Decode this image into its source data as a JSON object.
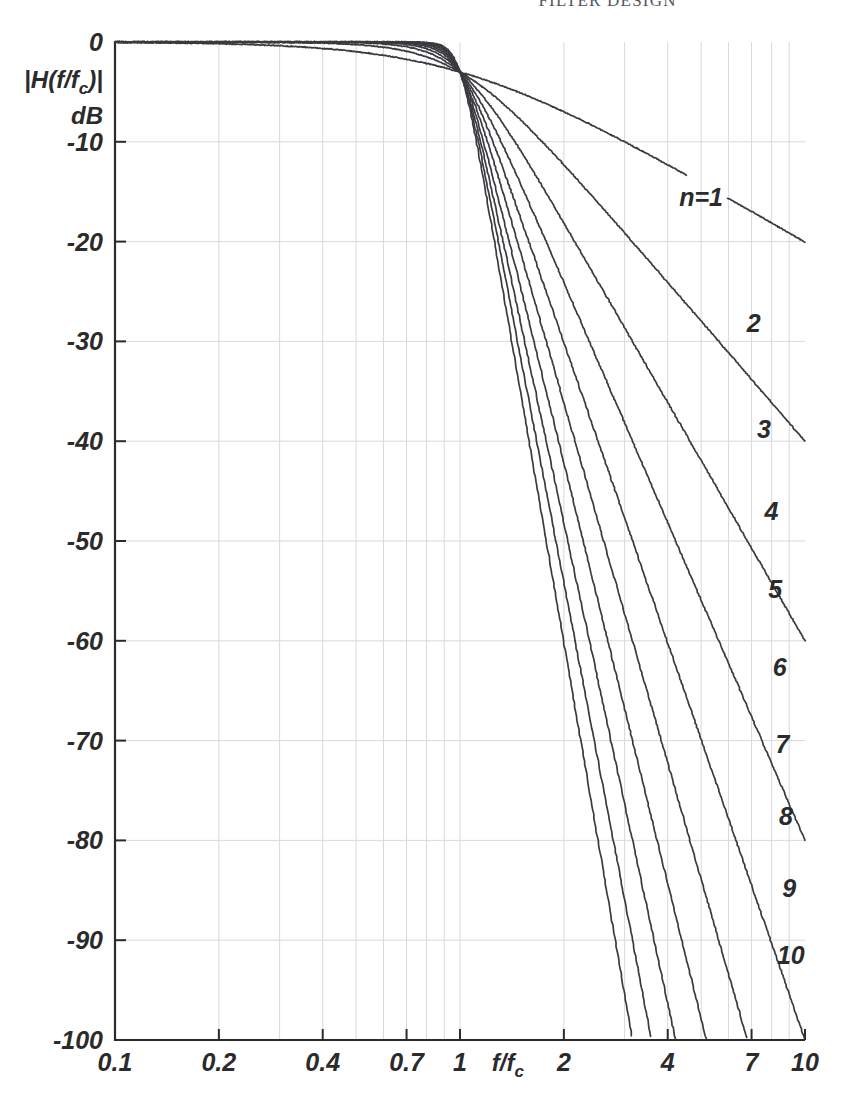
{
  "running_head": "FILTER DESIGN",
  "chart_data": {
    "type": "line",
    "title": "",
    "xlabel": "f/f",
    "xlabel_sub": "c",
    "ylabel_line1": "|H(f/f",
    "ylabel_line1_sub": "c",
    "ylabel_line1_end": ")|",
    "ylabel_line2": "dB",
    "xscale": "log",
    "yscale": "linear",
    "xlim": [
      0.1,
      10
    ],
    "ylim": [
      -100,
      0
    ],
    "grid": true,
    "legend_position": "inline-right",
    "xticks": [
      0.1,
      0.2,
      0.4,
      0.7,
      1,
      2,
      4,
      7,
      10
    ],
    "xtick_labels": [
      "0.1",
      "0.2",
      "0.4",
      "0.7",
      "1",
      "2",
      "4",
      "7",
      "10"
    ],
    "yticks": [
      0,
      -10,
      -20,
      -30,
      -40,
      -50,
      -60,
      -70,
      -80,
      -90,
      -100
    ],
    "ytick_labels": [
      "0",
      "-10",
      "-20",
      "-30",
      "-40",
      "-50",
      "-60",
      "-70",
      "-80",
      "-90",
      "-100"
    ],
    "minor_x_gridlines": [
      0.1,
      0.2,
      0.3,
      0.4,
      0.5,
      0.6,
      0.7,
      0.8,
      0.9,
      1,
      2,
      3,
      4,
      5,
      6,
      7,
      8,
      9,
      10
    ],
    "formula": "20*log10(1/sqrt(1+(f/fc)^(2n)))",
    "series": [
      {
        "name": "n=1",
        "order": 1,
        "label": "n=1",
        "label_x": 5.0,
        "label_y": -15.5,
        "value_at_10": -20.04
      },
      {
        "name": "n=2",
        "order": 2,
        "label": "2",
        "label_x": 7.1,
        "label_y": -28.2,
        "value_at_10": -40.0
      },
      {
        "name": "n=3",
        "order": 3,
        "label": "3",
        "label_x": 7.6,
        "label_y": -38.8,
        "value_at_10": -60.0
      },
      {
        "name": "n=4",
        "order": 4,
        "label": "4",
        "label_x": 8.0,
        "label_y": -47.0,
        "value_at_10": -80.0
      },
      {
        "name": "n=5",
        "order": 5,
        "label": "5",
        "label_x": 8.2,
        "label_y": -54.8,
        "value_at_10": -100.0
      },
      {
        "name": "n=6",
        "order": 6,
        "label": "6",
        "label_x": 8.45,
        "label_y": -62.6,
        "value_at_10": -120.0
      },
      {
        "name": "n=7",
        "order": 7,
        "label": "7",
        "label_x": 8.6,
        "label_y": -70.3,
        "value_at_10": -140.0
      },
      {
        "name": "n=8",
        "order": 8,
        "label": "8",
        "label_x": 8.8,
        "label_y": -77.6,
        "value_at_10": -160.0
      },
      {
        "name": "n=9",
        "order": 9,
        "label": "9",
        "label_x": 9.0,
        "label_y": -84.8,
        "value_at_10": -180.0
      },
      {
        "name": "n=10",
        "order": 10,
        "label": "10",
        "label_x": 9.1,
        "label_y": -91.5,
        "value_at_10": -200.0
      }
    ],
    "reference_points": [
      {
        "x": 1,
        "y": -3.01,
        "note": "all curves pass through -3 dB at f/fc = 1"
      }
    ],
    "colors": {
      "curve": "#3a3a3f",
      "axis": "#2b2b2b",
      "grid": "#d8d8de",
      "background": "#ffffff"
    }
  }
}
